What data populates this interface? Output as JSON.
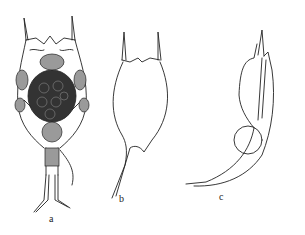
{
  "figure": {
    "panels": [
      {
        "id": "a",
        "label": "a",
        "description": "rotifer with internal organs, two anterior spines, foot with toes"
      },
      {
        "id": "b",
        "label": "b",
        "description": "lorica outline with two anterior spines and a posterior spine"
      },
      {
        "id": "c",
        "label": "c",
        "description": "lateral view of lorica with attached egg and long posterior spine"
      }
    ],
    "colors": {
      "line": "#222222",
      "background": "#ffffff",
      "fill_dark": "#333333",
      "fill_mid": "#9a9a9a"
    }
  }
}
